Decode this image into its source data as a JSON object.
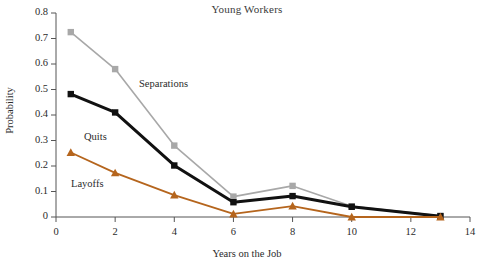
{
  "chart_data": {
    "type": "line",
    "title": "Young Workers",
    "xlabel": "Years on the Job",
    "ylabel": "Probability",
    "xlim": [
      0,
      14
    ],
    "ylim": [
      0,
      0.8
    ],
    "x": [
      0.5,
      2,
      4,
      6,
      8,
      10,
      13
    ],
    "grid": false,
    "legend_position": "inline-annotations",
    "xticks": [
      "0",
      "2",
      "4",
      "6",
      "8",
      "10",
      "12",
      "14"
    ],
    "xtick_values": [
      0,
      2,
      4,
      6,
      8,
      10,
      12,
      14
    ],
    "yticks": [
      "0",
      "0.1",
      "0.2",
      "0.3",
      "0.4",
      "0.5",
      "0.6",
      "0.7",
      "0.8"
    ],
    "ytick_values": [
      0,
      0.1,
      0.2,
      0.3,
      0.4,
      0.5,
      0.6,
      0.7,
      0.8
    ],
    "series": [
      {
        "name": "Separations",
        "color": "#a8a8a8",
        "marker": "square",
        "line_width": 1.6,
        "values": [
          0.725,
          0.58,
          0.28,
          0.08,
          0.122,
          0.042,
          0.005
        ]
      },
      {
        "name": "Quits",
        "color": "#111111",
        "marker": "square",
        "line_width": 3.0,
        "values": [
          0.482,
          0.41,
          0.202,
          0.058,
          0.082,
          0.04,
          0.003
        ]
      },
      {
        "name": "Layoffs",
        "color": "#b5651d",
        "marker": "triangle",
        "line_width": 1.8,
        "values": [
          0.253,
          0.173,
          0.086,
          0.012,
          0.043,
          0.0,
          0.0
        ]
      }
    ],
    "annotations": [
      {
        "text": "Separations",
        "series": "Separations"
      },
      {
        "text": "Quits",
        "series": "Quits"
      },
      {
        "text": "Layoffs",
        "series": "Layoffs"
      }
    ]
  }
}
